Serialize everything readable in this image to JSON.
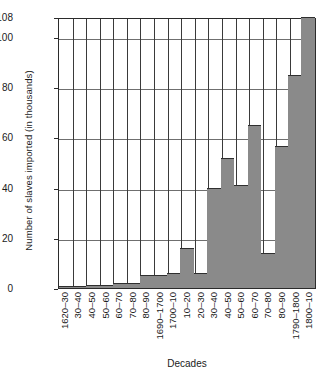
{
  "chart_data": {
    "type": "bar",
    "title": "",
    "xlabel": "Decades",
    "ylabel": "Number of slaves imported (in thousands)",
    "ylim": [
      0,
      108
    ],
    "yticks": [
      0,
      20,
      40,
      60,
      80,
      100,
      108
    ],
    "grid": true,
    "legend": null,
    "bar_color": "#8a8a8a",
    "categories": [
      "1620–30",
      "30–40",
      "40–50",
      "50–60",
      "60–70",
      "70–80",
      "80–90",
      "1690–1700",
      "1700–10",
      "10–20",
      "20–30",
      "30–40",
      "40–50",
      "50–60",
      "60–70",
      "70–80",
      "80–90",
      "1790–1800",
      "1800–10"
    ],
    "values": [
      1,
      1,
      1.2,
      1.2,
      2,
      2,
      5,
      5,
      6,
      16,
      6,
      40,
      52,
      41,
      65,
      14,
      56.5,
      85,
      108
    ]
  }
}
